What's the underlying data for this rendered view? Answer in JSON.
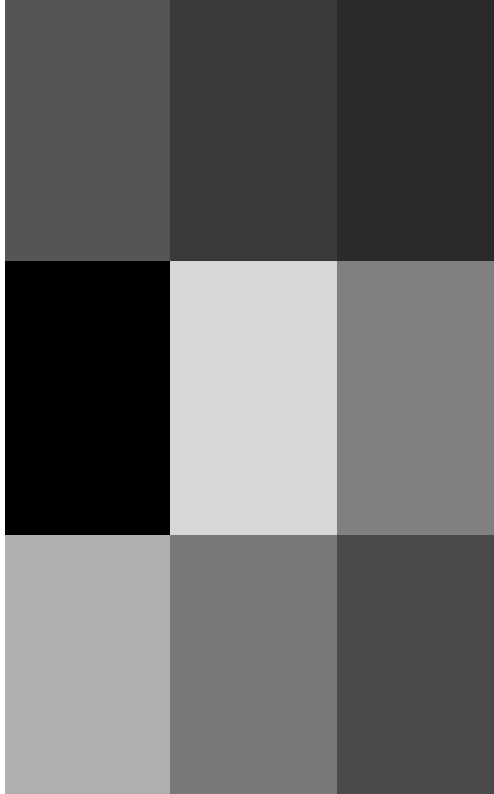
{
  "page": {
    "width": 494,
    "height": 794,
    "background": "#ffffff"
  },
  "layout": {
    "left_margin_px": 5,
    "column_edges": [
      5,
      170,
      337,
      494
    ],
    "row_edges": [
      0,
      261,
      535,
      794
    ],
    "rows": 3,
    "columns": 3
  },
  "chart_data": {
    "type": "heatmap",
    "subtitle": "",
    "xlabel": "",
    "ylabel": "",
    "grid": false,
    "legend_position": "none",
    "categories_x": [
      "Column 1",
      "Column 2",
      "Column 3"
    ],
    "categories_y": [
      "Row 1",
      "Row 2",
      "Row 3"
    ],
    "colorscale": "grayscale",
    "values": [
      [
        85,
        58,
        42
      ],
      [
        0,
        215,
        128
      ],
      [
        175,
        121,
        74
      ]
    ],
    "colors": [
      [
        "#555555",
        "#3a3a3a",
        "#2a2a2a"
      ],
      [
        "#000000",
        "#d7d7d7",
        "#808080"
      ],
      [
        "#afafaf",
        "#797979",
        "#4a4a4a"
      ]
    ]
  },
  "tiles": [
    {
      "id": "tile-r1c1",
      "row": 1,
      "column": 1,
      "color": "#555555",
      "gray_value": 85,
      "x": 5,
      "y": 0,
      "width": 165,
      "height": 261
    },
    {
      "id": "tile-r1c2",
      "row": 1,
      "column": 2,
      "color": "#3a3a3a",
      "gray_value": 58,
      "x": 170,
      "y": 0,
      "width": 167,
      "height": 261
    },
    {
      "id": "tile-r1c3",
      "row": 1,
      "column": 3,
      "color": "#2a2a2a",
      "gray_value": 42,
      "x": 337,
      "y": 0,
      "width": 157,
      "height": 261
    },
    {
      "id": "tile-r2c1",
      "row": 2,
      "column": 1,
      "color": "#000000",
      "gray_value": 0,
      "x": 5,
      "y": 261,
      "width": 165,
      "height": 274
    },
    {
      "id": "tile-r2c2",
      "row": 2,
      "column": 2,
      "color": "#d7d7d7",
      "gray_value": 215,
      "x": 170,
      "y": 261,
      "width": 167,
      "height": 274
    },
    {
      "id": "tile-r2c3",
      "row": 2,
      "column": 3,
      "color": "#808080",
      "gray_value": 128,
      "x": 337,
      "y": 261,
      "width": 157,
      "height": 274
    },
    {
      "id": "tile-r3c1",
      "row": 3,
      "column": 1,
      "color": "#afafaf",
      "gray_value": 175,
      "x": 5,
      "y": 535,
      "width": 165,
      "height": 259
    },
    {
      "id": "tile-r3c2",
      "row": 3,
      "column": 2,
      "color": "#797979",
      "gray_value": 121,
      "x": 170,
      "y": 535,
      "width": 167,
      "height": 259
    },
    {
      "id": "tile-r3c3",
      "row": 3,
      "column": 3,
      "color": "#4a4a4a",
      "gray_value": 74,
      "x": 337,
      "y": 535,
      "width": 157,
      "height": 259
    }
  ]
}
